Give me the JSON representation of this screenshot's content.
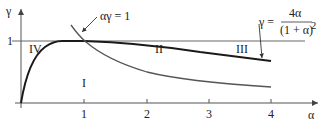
{
  "axes": {
    "y_label": "γ",
    "x_label": "α",
    "y_tick_label": "1",
    "x_ticks": [
      "1",
      "2",
      "3",
      "4"
    ]
  },
  "regions": {
    "r1": "I",
    "r2": "II",
    "r3": "III",
    "r4": "IV"
  },
  "annotations": {
    "hyperbola": "αγ = 1",
    "curve_lhs": "γ =",
    "curve_num": "4α",
    "curve_den": "(1 + α)",
    "curve_den_exp": "2"
  },
  "colors": {
    "axis": "#555555",
    "main_curve": "#1a1a1a",
    "hyperbola": "#555555"
  }
}
